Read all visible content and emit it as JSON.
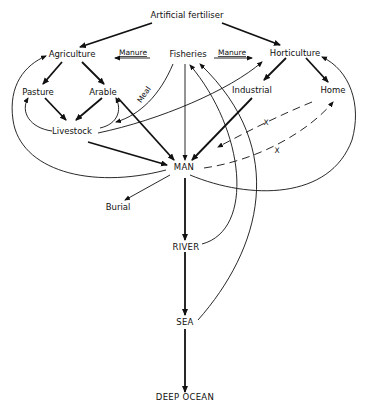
{
  "diagram": {
    "nodes": {
      "fertiliser": "Artificial fertiliser",
      "agriculture": "Agriculture",
      "fisheries": "Fisheries",
      "horticulture": "Horticulture",
      "pasture": "Pasture",
      "arable": "Arable",
      "industrial": "Industrial",
      "home": "Home",
      "livestock": "Livestock",
      "man": "MAN",
      "burial": "Burial",
      "river": "RIVER",
      "sea": "SEA",
      "deep_ocean": "DEEP OCEAN"
    },
    "edge_labels": {
      "manure_left": "Manure",
      "manure_right": "Manure",
      "meal": "Meal",
      "x1": "X",
      "x2": "X"
    },
    "edges": [
      {
        "from": "Artificial fertiliser",
        "to": "Agriculture",
        "style": "thick"
      },
      {
        "from": "Artificial fertiliser",
        "to": "Horticulture",
        "style": "thick"
      },
      {
        "from": "Fisheries",
        "to": "Agriculture",
        "label": "Manure",
        "style": "thin"
      },
      {
        "from": "Fisheries",
        "to": "Horticulture",
        "label": "Manure",
        "style": "thin"
      },
      {
        "from": "Agriculture",
        "to": "Pasture",
        "style": "thick"
      },
      {
        "from": "Agriculture",
        "to": "Arable",
        "style": "thick"
      },
      {
        "from": "Pasture",
        "to": "Livestock",
        "style": "thick"
      },
      {
        "from": "Arable",
        "to": "Livestock",
        "style": "thick"
      },
      {
        "from": "Livestock",
        "to": "Pasture",
        "style": "thin-curve"
      },
      {
        "from": "Livestock",
        "to": "Arable",
        "style": "thin-curve"
      },
      {
        "from": "Fisheries",
        "to": "Livestock",
        "label": "Meal",
        "style": "thin-curve"
      },
      {
        "from": "Livestock",
        "to": "Horticulture",
        "style": "thin-curve"
      },
      {
        "from": "Livestock",
        "to": "MAN",
        "style": "thick"
      },
      {
        "from": "Arable",
        "to": "MAN",
        "style": "thick"
      },
      {
        "from": "Fisheries",
        "to": "MAN",
        "style": "thin"
      },
      {
        "from": "Industrial",
        "to": "MAN",
        "style": "thick"
      },
      {
        "from": "Horticulture",
        "to": "Industrial",
        "style": "thick"
      },
      {
        "from": "Horticulture",
        "to": "Home",
        "style": "thick"
      },
      {
        "from": "Home",
        "to": "MAN",
        "label": "X",
        "style": "dashed"
      },
      {
        "from": "MAN",
        "to": "Home",
        "label": "X",
        "style": "dashed"
      },
      {
        "from": "MAN",
        "to": "Agriculture",
        "style": "thin-curve"
      },
      {
        "from": "MAN",
        "to": "Horticulture",
        "style": "thin-curve"
      },
      {
        "from": "MAN",
        "to": "Burial",
        "style": "thin"
      },
      {
        "from": "MAN",
        "to": "RIVER",
        "style": "thick"
      },
      {
        "from": "RIVER",
        "to": "Fisheries",
        "style": "thin-curve"
      },
      {
        "from": "RIVER",
        "to": "SEA",
        "style": "thick"
      },
      {
        "from": "SEA",
        "to": "Fisheries",
        "style": "thin-curve"
      },
      {
        "from": "SEA",
        "to": "DEEP OCEAN",
        "style": "thick"
      }
    ]
  }
}
